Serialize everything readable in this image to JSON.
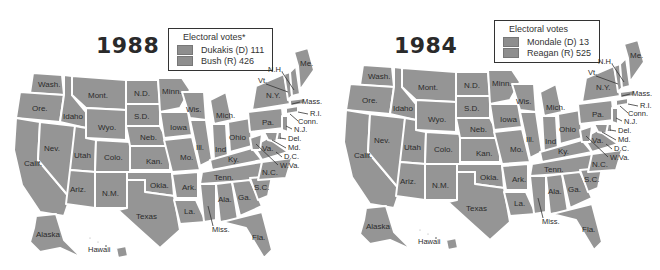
{
  "maps": [
    {
      "year": "1988",
      "legend": {
        "title": "Electoral votes*",
        "entries": [
          {
            "label": "Dukakis (D) 111",
            "candidate": "Dukakis",
            "party": "D",
            "votes": 111
          },
          {
            "label": "Bush (R) 426",
            "candidate": "Bush",
            "party": "R",
            "votes": 426
          }
        ]
      }
    },
    {
      "year": "1984",
      "legend": {
        "title": "Electoral votes",
        "entries": [
          {
            "label": "Mondale (D) 13",
            "candidate": "Mondale",
            "party": "D",
            "votes": 13
          },
          {
            "label": "Reagan (R) 525",
            "candidate": "Reagan",
            "party": "R",
            "votes": 525
          }
        ]
      }
    }
  ],
  "state_labels": {
    "wash": "Wash.",
    "ore": "Ore.",
    "calif": "Calif.",
    "idaho": "Idaho",
    "nev": "Nev.",
    "mont": "Mont.",
    "wyo": "Wyo.",
    "utah": "Utah",
    "colo": "Colo.",
    "ariz": "Ariz.",
    "nm": "N.M.",
    "nd": "N.D.",
    "sd": "S.D.",
    "neb": "Neb.",
    "kan": "Kan.",
    "okla": "Okla.",
    "texas": "Texas",
    "minn": "Minn.",
    "iowa": "Iowa",
    "mo": "Mo.",
    "ark": "Ark.",
    "la": "La.",
    "wis": "Wis.",
    "ill": "Ill.",
    "mich": "Mich.",
    "ind": "Ind",
    "ohio": "Ohio",
    "ky": "Ky.",
    "tenn": "Tenn.",
    "miss": "Miss.",
    "ala": "Ala.",
    "ga": "Ga.",
    "fla": "Fla.",
    "sc": "S.C.",
    "nc": "N.C.",
    "va": "Va.",
    "wva": "W.Va.",
    "pa": "Pa.",
    "ny": "N.Y.",
    "vt": "Vt.",
    "nh": "N.H.",
    "me": "Me.",
    "mass": "Mass.",
    "ri": "R.I.",
    "conn": "Conn.",
    "nj": "N.J.",
    "del": "Del.",
    "md": "Md.",
    "dc": "D.C.",
    "alaska": "Alaska",
    "hawaii": "Hawaii"
  },
  "colors": {
    "state_fill": "#959595",
    "border": "#ffffff",
    "text": "#2b2b2b"
  }
}
